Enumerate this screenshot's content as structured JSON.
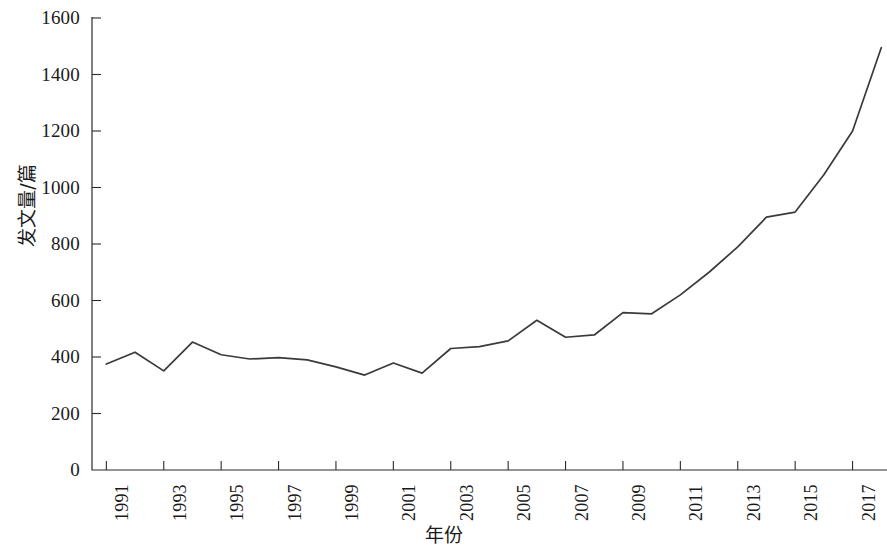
{
  "chart_data": {
    "type": "line",
    "title": "",
    "xlabel": "年份",
    "ylabel": "发文量/篇",
    "xlim": [
      1990.5,
      2018.2
    ],
    "ylim": [
      0,
      1600
    ],
    "grid": false,
    "legend": null,
    "line_color": "#3a3a3a",
    "x": [
      1991,
      1992,
      1993,
      1994,
      1995,
      1996,
      1997,
      1998,
      1999,
      2000,
      2001,
      2002,
      2003,
      2004,
      2005,
      2006,
      2007,
      2008,
      2009,
      2010,
      2011,
      2012,
      2013,
      2014,
      2015,
      2016,
      2017,
      2018
    ],
    "values": [
      375,
      417,
      351,
      453,
      408,
      393,
      398,
      390,
      365,
      336,
      379,
      343,
      430,
      437,
      457,
      530,
      470,
      478,
      557,
      553,
      620,
      700,
      790,
      895,
      913,
      1045,
      1200,
      1495
    ],
    "series": [
      {
        "name": "发文量",
        "values": [
          375,
          417,
          351,
          453,
          408,
          393,
          398,
          390,
          365,
          336,
          379,
          343,
          430,
          437,
          457,
          530,
          470,
          478,
          557,
          553,
          620,
          700,
          790,
          895,
          913,
          1045,
          1200,
          1495
        ]
      }
    ],
    "y_ticks": [
      0,
      200,
      400,
      600,
      800,
      1000,
      1200,
      1400,
      1600
    ],
    "y_tick_labels": [
      "0",
      "200",
      "400",
      "600",
      "800",
      "1000",
      "1200",
      "1400",
      "1600"
    ],
    "x_ticks": [
      1991,
      1993,
      1995,
      1997,
      1999,
      2001,
      2003,
      2005,
      2007,
      2009,
      2011,
      2013,
      2015,
      2017
    ],
    "x_tick_labels": [
      "1991",
      "1993",
      "1995",
      "1997",
      "1999",
      "2001",
      "2003",
      "2005",
      "2007",
      "2009",
      "2011",
      "2013",
      "2015",
      "2017"
    ]
  }
}
